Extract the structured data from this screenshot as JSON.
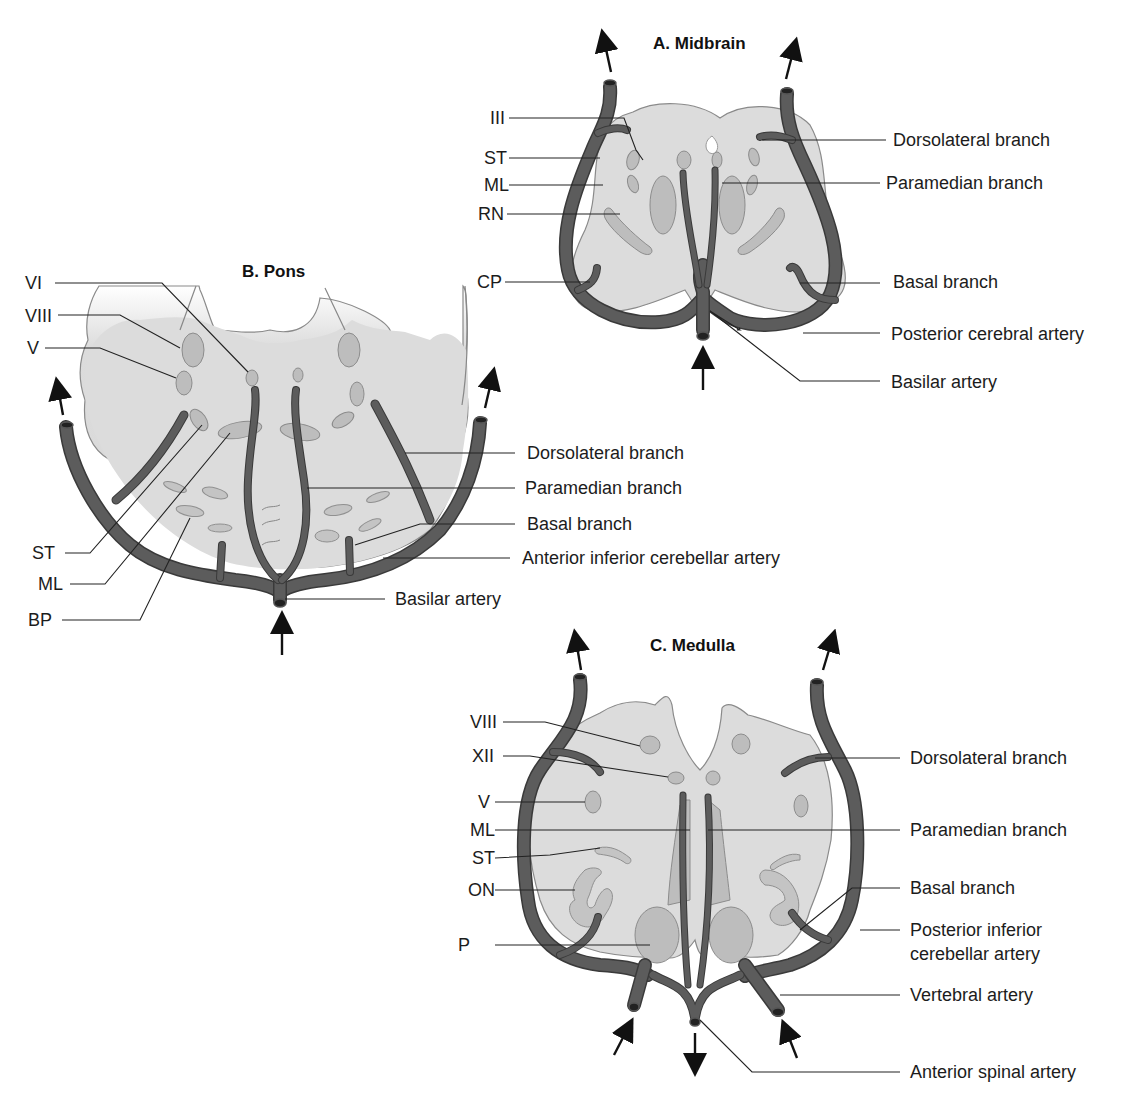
{
  "figure": {
    "panels": [
      {
        "id": "midbrain",
        "title": "A. Midbrain",
        "left_labels": [
          "III",
          "ST",
          "ML",
          "RN",
          "CP"
        ],
        "right_labels": [
          "Dorsolateral branch",
          "Paramedian branch",
          "Basal branch",
          "Posterior cerebral artery",
          "Basilar artery"
        ]
      },
      {
        "id": "pons",
        "title": "B. Pons",
        "left_labels": [
          "VI",
          "VIII",
          "V",
          "ST",
          "ML",
          "BP"
        ],
        "right_labels": [
          "Dorsolateral branch",
          "Paramedian branch",
          "Basal branch",
          "Anterior inferior cerebellar artery",
          "Basilar artery"
        ]
      },
      {
        "id": "medulla",
        "title": "C. Medulla",
        "left_labels": [
          "VIII",
          "XII",
          "V",
          "ML",
          "ST",
          "ON",
          "P"
        ],
        "right_labels": [
          "Dorsolateral branch",
          "Paramedian branch",
          "Basal branch",
          "Posterior inferior",
          "cerebellar artery",
          "Vertebral artery",
          "Anterior spinal artery"
        ]
      }
    ],
    "colors": {
      "tissue": "#dcdcdc",
      "nuclei": "#bdbdbd",
      "artery": "#5c5c5c",
      "artery_outline": "#3a3a3a",
      "text": "#1c1c1c"
    },
    "icons": {
      "flow_arrow": "arrow-icon"
    }
  }
}
